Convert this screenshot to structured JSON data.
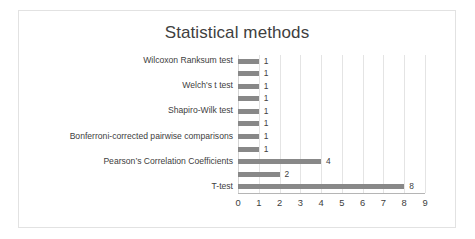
{
  "chart_data": {
    "type": "bar",
    "orientation": "horizontal",
    "title": "Statistical methods",
    "xlabel": "",
    "ylabel": "",
    "xlim": [
      0,
      9
    ],
    "xticks": [
      "0",
      "1",
      "2",
      "3",
      "4",
      "5",
      "6",
      "7",
      "8",
      "9"
    ],
    "grid": "vertical",
    "legend": "none",
    "bar_color": "#888888",
    "gridline_color": "#e4e4e4",
    "text_color": "#404040",
    "categories": [
      "Wilcoxon Ranksum test",
      "",
      "Welch's t test",
      "",
      "Shapiro-Wilk test",
      "",
      "Bonferroni-corrected pairwise comparisons",
      "",
      "Pearson’s Correlation Coefficients",
      "",
      "T-test"
    ],
    "values": [
      1,
      1,
      1,
      1,
      1,
      1,
      1,
      1,
      4,
      2,
      8
    ],
    "value_labels": [
      "1",
      "1",
      "1",
      "1",
      "1",
      "1",
      "1",
      "1",
      "4",
      "2",
      "8"
    ]
  }
}
